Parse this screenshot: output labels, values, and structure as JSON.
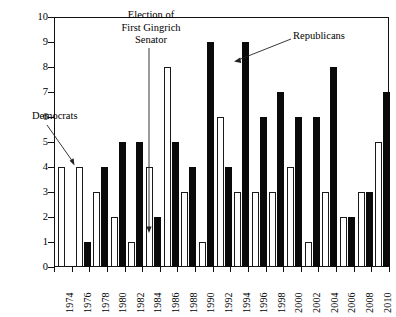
{
  "chart_data": {
    "type": "bar",
    "title": "",
    "subtitle": "",
    "xlabel": "",
    "ylabel": "",
    "ylim": [
      0,
      10
    ],
    "yticks": [
      0,
      1,
      2,
      3,
      4,
      5,
      6,
      7,
      8,
      9,
      10
    ],
    "grid": false,
    "legend_position": "annotations",
    "categories": [
      "1974",
      "1976",
      "1978",
      "1980",
      "1982",
      "1984",
      "1986",
      "1988",
      "1990",
      "1992",
      "1994",
      "1996",
      "1998",
      "2000",
      "2002",
      "2004",
      "2006",
      "2008",
      "2010"
    ],
    "series": [
      {
        "name": "Democrats",
        "color": "#ffffff",
        "edge_color": "#1a1a1a",
        "values": [
          4,
          4,
          3,
          2,
          1,
          4,
          8,
          3,
          1,
          6,
          3,
          3,
          3,
          4,
          1,
          3,
          2,
          3,
          5
        ]
      },
      {
        "name": "Republicans",
        "color": "#0a0a0a",
        "edge_color": "#0a0a0a",
        "values": [
          0,
          1,
          4,
          5,
          5,
          2,
          5,
          4,
          9,
          4,
          9,
          6,
          7,
          6,
          6,
          8,
          2,
          3,
          7
        ]
      }
    ],
    "annotations": [
      {
        "id": "gingrich",
        "text_lines": [
          "Election of",
          "First Gingrich",
          "Senator"
        ],
        "points_to": "1984"
      },
      {
        "id": "democrats",
        "text": "Democrats",
        "points_to": "1976-democrat-bar"
      },
      {
        "id": "republicans",
        "text": "Republicans",
        "points_to": "1994-republican-bar"
      }
    ]
  },
  "yaxis": {
    "labels": [
      "10",
      "9",
      "8",
      "7",
      "6",
      "5",
      "4",
      "3",
      "2",
      "1",
      "0"
    ]
  },
  "xaxis": {
    "labels": [
      "1974",
      "1976",
      "1978",
      "1980",
      "1982",
      "1984",
      "1986",
      "1988",
      "1990",
      "1992",
      "1994",
      "1996",
      "1998",
      "2000",
      "2002",
      "2004",
      "2006",
      "2008",
      "2010"
    ]
  },
  "annotations": {
    "gingrich_line1": "Election of",
    "gingrich_line2": "First Gingrich",
    "gingrich_line3": "Senator",
    "democrats": "Democrats",
    "republicans": "Republicans"
  }
}
